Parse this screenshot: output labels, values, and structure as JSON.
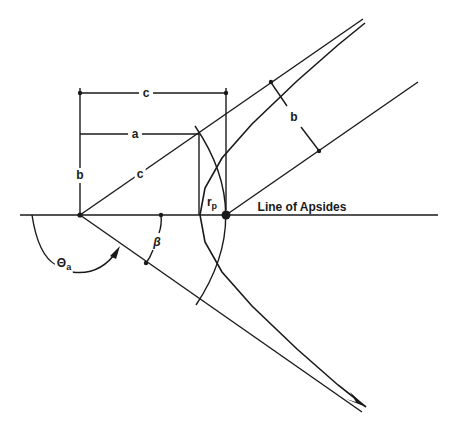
{
  "diagram": {
    "labels": {
      "c_top": "c",
      "a": "a",
      "b_left": "b",
      "c_diag": "c",
      "r": "r",
      "r_sub": "p",
      "beta": "β",
      "theta": "Θ",
      "theta_sub": "a",
      "b_right": "b",
      "line_of_apsides": "Line of Apsides"
    },
    "points": {
      "center": [
        80,
        215
      ],
      "focus": [
        226,
        215
      ],
      "vertex": [
        200,
        215
      ]
    },
    "colors": {
      "ink": "#1a1a1a",
      "background": "#ffffff"
    }
  }
}
